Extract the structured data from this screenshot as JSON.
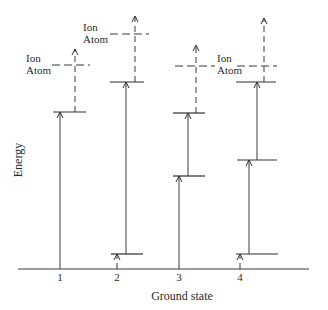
{
  "diagram": {
    "axis": {
      "y_label": "Energy",
      "x_label": "Ground state",
      "ticks": [
        "1",
        "2",
        "3",
        "4"
      ]
    },
    "columns": [
      {
        "id": "1",
        "labels": {
          "upper": "Ion",
          "lower": "Atom"
        },
        "transitions": [
          "ground-to-excited (solid)",
          "excited-to-ionization (dashed)"
        ]
      },
      {
        "id": "2",
        "labels": {
          "upper": "Ion",
          "lower": "Atom"
        },
        "transitions": [
          "ground-to-low-level (dashed)",
          "low-to-excited (solid)",
          "excited-to-ionization (dashed)"
        ]
      },
      {
        "id": "3",
        "labels": {
          "upper": "Ion",
          "lower": "Atom"
        },
        "transitions": [
          "ground-to-intermediate (solid)",
          "intermediate-to-excited (solid)",
          "excited-to-ionization (dashed)"
        ]
      },
      {
        "id": "4",
        "labels": {},
        "transitions": [
          "ground-to-low-level (dashed)",
          "low-to-intermediate (solid)",
          "intermediate-to-excited (solid)",
          "excited-to-ionization (dashed)"
        ]
      }
    ],
    "colors": {
      "ink": "#2e2e2e",
      "background": "#ffffff"
    }
  }
}
